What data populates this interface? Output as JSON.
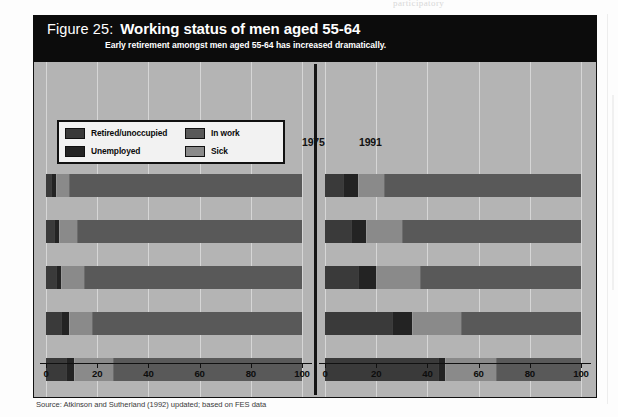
{
  "page": {
    "ghost_text": "participatory"
  },
  "figure": {
    "number_label": "Figure 25:",
    "title": "Working status of men aged 55-64",
    "subtitle": "Early retirement amongst men aged 55-64 has increased dramatically.",
    "source": "Source: Atkinson and Sutherland (1992) updated; based on FES data"
  },
  "legend": {
    "items": [
      {
        "label": "Retired/unoccupied",
        "key": "retired",
        "color": "#3a3a3a"
      },
      {
        "label": "In work",
        "key": "inwork",
        "color": "#595959"
      },
      {
        "label": "Unemployed",
        "key": "unemp",
        "color": "#232323"
      },
      {
        "label": "Sick",
        "key": "sick",
        "color": "#8a8a8a"
      }
    ]
  },
  "panels": [
    {
      "id": "panel-1975",
      "year_label": "1975"
    },
    {
      "id": "panel-1991",
      "year_label": "1991"
    }
  ],
  "axis": {
    "label": "Percentage",
    "ticks": [
      "0",
      "20",
      "40",
      "60",
      "80",
      "100"
    ],
    "min": 0,
    "max": 100
  },
  "categories": [
    "55-56",
    "57-58",
    "59-60",
    "61-62",
    "63-64"
  ],
  "chart_data": {
    "type": "bar",
    "orientation": "horizontal",
    "stacked": true,
    "title": "Working status of men aged 55-64",
    "subtitle": "Early retirement amongst men aged 55-64 has increased dramatically.",
    "xlabel": "Percentage",
    "ylabel": "",
    "xlim": [
      0,
      100
    ],
    "categories": [
      "55-56",
      "57-58",
      "59-60",
      "61-62",
      "63-64"
    ],
    "legend_position": "top-left",
    "grid": true,
    "panels": [
      {
        "name": "1975",
        "series": [
          {
            "name": "Retired/unoccupied",
            "color": "#3a3a3a",
            "values": [
              2,
              3,
              4,
              6,
              8
            ]
          },
          {
            "name": "Unemployed",
            "color": "#232323",
            "values": [
              2,
              2,
              2,
              3,
              3
            ]
          },
          {
            "name": "Sick",
            "color": "#8a8a8a",
            "values": [
              5,
              7,
              9,
              9,
              15
            ]
          },
          {
            "name": "In work",
            "color": "#595959",
            "values": [
              91,
              88,
              85,
              82,
              74
            ]
          }
        ]
      },
      {
        "name": "1991",
        "series": [
          {
            "name": "Retired/unoccupied",
            "color": "#3a3a3a",
            "values": [
              7,
              10,
              13,
              26,
              44
            ]
          },
          {
            "name": "Unemployed",
            "color": "#232323",
            "values": [
              6,
              6,
              7,
              8,
              3
            ]
          },
          {
            "name": "Sick",
            "color": "#8a8a8a",
            "values": [
              10,
              14,
              17,
              19,
              20
            ]
          },
          {
            "name": "In work",
            "color": "#595959",
            "values": [
              77,
              70,
              63,
              47,
              33
            ]
          }
        ]
      }
    ]
  }
}
